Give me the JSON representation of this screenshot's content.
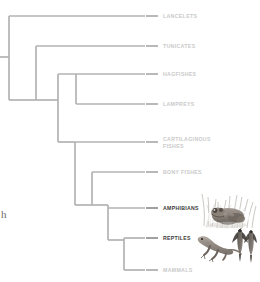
{
  "figure": {
    "kind": "phylogenetic-tree",
    "orientation": "left-root-right-tips",
    "branch_color": "#b3b3b3",
    "tick_color": "#b8b8b8",
    "label_color_default": "#c9c9c9",
    "label_color_emphasis": "#3a3a3a",
    "background": "#ffffff",
    "edge_fragment": "h"
  },
  "taxa": [
    {
      "id": "lancelets",
      "label": "LANCELETS",
      "y": 16,
      "emphasis": false,
      "tick_x": 146,
      "label_x": 163
    },
    {
      "id": "tunicates",
      "label": "TUNICATES",
      "y": 46,
      "emphasis": false,
      "tick_x": 146,
      "label_x": 163
    },
    {
      "id": "hagfishes",
      "label": "HAGFISHES",
      "y": 74,
      "emphasis": false,
      "tick_x": 146,
      "label_x": 163
    },
    {
      "id": "lampreys",
      "label": "LAMPREYS",
      "y": 104,
      "emphasis": false,
      "tick_x": 146,
      "label_x": 163
    },
    {
      "id": "cartilaginous-fishes",
      "label": "CARTILAGINOUS\nFISHES",
      "y": 142,
      "emphasis": false,
      "tick_x": 146,
      "label_x": 163
    },
    {
      "id": "bony-fishes",
      "label": "BONY FISHES",
      "y": 172,
      "emphasis": false,
      "tick_x": 146,
      "label_x": 163
    },
    {
      "id": "amphibians",
      "label": "AMPHIBIANS",
      "y": 208,
      "emphasis": true,
      "tick_x": 146,
      "label_x": 163
    },
    {
      "id": "reptiles",
      "label": "REPTILES",
      "y": 238,
      "emphasis": true,
      "tick_x": 146,
      "label_x": 163
    },
    {
      "id": "mammals",
      "label": "MAMMALS",
      "y": 270,
      "emphasis": false,
      "tick_x": 146,
      "label_x": 163
    }
  ],
  "illustrations": [
    {
      "id": "frog-in-grass",
      "name": "frog-illustration",
      "x": 198,
      "y": 186,
      "width": 60,
      "height": 44
    },
    {
      "id": "lizard-and-birds",
      "name": "reptile-illustration",
      "x": 196,
      "y": 226,
      "width": 62,
      "height": 42
    }
  ]
}
